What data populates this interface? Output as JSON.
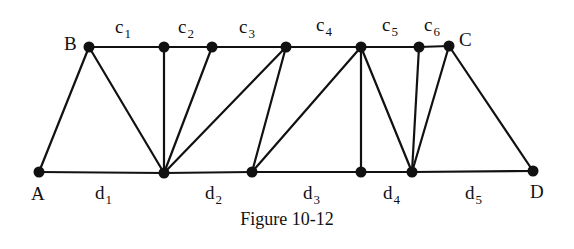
{
  "figure": {
    "caption": "Figure 10-12"
  },
  "nodes": [
    {
      "id": "B",
      "x": 89,
      "y": 47,
      "label": "B",
      "lx": 64,
      "ly": 50
    },
    {
      "id": "T2",
      "x": 164,
      "y": 47,
      "label": ""
    },
    {
      "id": "T3",
      "x": 212,
      "y": 47,
      "label": ""
    },
    {
      "id": "T4",
      "x": 286,
      "y": 47,
      "label": ""
    },
    {
      "id": "T5",
      "x": 361,
      "y": 47,
      "label": ""
    },
    {
      "id": "T6",
      "x": 419,
      "y": 47,
      "label": ""
    },
    {
      "id": "C",
      "x": 449,
      "y": 46,
      "label": "C",
      "lx": 459,
      "ly": 46
    },
    {
      "id": "A",
      "x": 39,
      "y": 172,
      "label": "A",
      "lx": 31,
      "ly": 200
    },
    {
      "id": "M1",
      "x": 164,
      "y": 173,
      "label": ""
    },
    {
      "id": "M2",
      "x": 252,
      "y": 172,
      "label": ""
    },
    {
      "id": "M3",
      "x": 361,
      "y": 172,
      "label": ""
    },
    {
      "id": "M4",
      "x": 412,
      "y": 172,
      "label": ""
    },
    {
      "id": "D",
      "x": 533,
      "y": 171,
      "label": "D",
      "lx": 530,
      "ly": 198
    }
  ],
  "edges": [
    [
      "B",
      "T2"
    ],
    [
      "T2",
      "T3"
    ],
    [
      "T3",
      "T4"
    ],
    [
      "T4",
      "T5"
    ],
    [
      "T5",
      "T6"
    ],
    [
      "T6",
      "C"
    ],
    [
      "A",
      "M1"
    ],
    [
      "M1",
      "M2"
    ],
    [
      "M2",
      "M3"
    ],
    [
      "M3",
      "M4"
    ],
    [
      "M4",
      "D"
    ],
    [
      "A",
      "B"
    ],
    [
      "B",
      "M1"
    ],
    [
      "T2",
      "M1"
    ],
    [
      "T3",
      "M1"
    ],
    [
      "T4",
      "M1"
    ],
    [
      "T4",
      "M2"
    ],
    [
      "T5",
      "M2"
    ],
    [
      "T5",
      "M3"
    ],
    [
      "T5",
      "M4"
    ],
    [
      "T6",
      "M4"
    ],
    [
      "C",
      "M4"
    ],
    [
      "C",
      "D"
    ]
  ],
  "top_segment_labels": [
    {
      "base": "c",
      "sub": "1",
      "x": 115,
      "y": 33
    },
    {
      "base": "c",
      "sub": "2",
      "x": 178,
      "y": 33
    },
    {
      "base": "c",
      "sub": "3",
      "x": 239,
      "y": 33
    },
    {
      "base": "c",
      "sub": "4",
      "x": 316,
      "y": 31
    },
    {
      "base": "c",
      "sub": "5",
      "x": 382,
      "y": 31
    },
    {
      "base": "c",
      "sub": "6",
      "x": 424,
      "y": 31
    }
  ],
  "bottom_segment_labels": [
    {
      "base": "d",
      "sub": "1",
      "x": 95,
      "y": 199
    },
    {
      "base": "d",
      "sub": "2",
      "x": 205,
      "y": 199
    },
    {
      "base": "d",
      "sub": "3",
      "x": 303,
      "y": 199
    },
    {
      "base": "d",
      "sub": "4",
      "x": 383,
      "y": 199
    },
    {
      "base": "d",
      "sub": "5",
      "x": 465,
      "y": 199
    }
  ]
}
